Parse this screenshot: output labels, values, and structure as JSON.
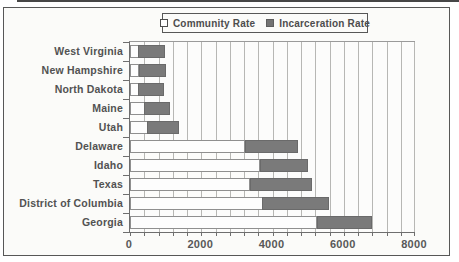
{
  "legend": {
    "items": [
      {
        "label": "Community Rate",
        "swatch": "outline",
        "color": "#fdfdfd"
      },
      {
        "label": "Incarceration Rate",
        "swatch": "filled",
        "color": "#737373"
      }
    ]
  },
  "chart_data": {
    "type": "bar",
    "orientation": "horizontal",
    "stacked": true,
    "title": "",
    "categories": [
      "West Virginia",
      "New Hampshire",
      "North Dakota",
      "Maine",
      "Utah",
      "Delaware",
      "Idaho",
      "Texas",
      "District of Columbia",
      "Georgia"
    ],
    "series": [
      {
        "name": "Community Rate",
        "color": "#fdfdfd",
        "border": "#8f8f8f",
        "values": [
          250,
          260,
          240,
          420,
          500,
          3240,
          3660,
          3380,
          3730,
          5260
        ]
      },
      {
        "name": "Incarceration Rate",
        "color": "#7a7a7a",
        "border": "#6a6a6a",
        "values": [
          750,
          770,
          720,
          730,
          900,
          1500,
          1340,
          1740,
          1880,
          1550
        ]
      }
    ],
    "xlim": [
      0,
      8000
    ],
    "x_ticks": [
      0,
      2000,
      4000,
      6000,
      8000
    ],
    "x_tick_labels": [
      "0",
      "2000",
      "4000",
      "6000",
      "8000"
    ],
    "x_minor_tick_step": 400,
    "grid": "vertical-minor-every-400",
    "legend_position": "top-center"
  },
  "colors": {
    "axis": "#6e6e6e",
    "gridline": "#b7b7b4",
    "text": "#525252",
    "figure_border": "#575757",
    "figure_background": "#fbfbf9"
  }
}
